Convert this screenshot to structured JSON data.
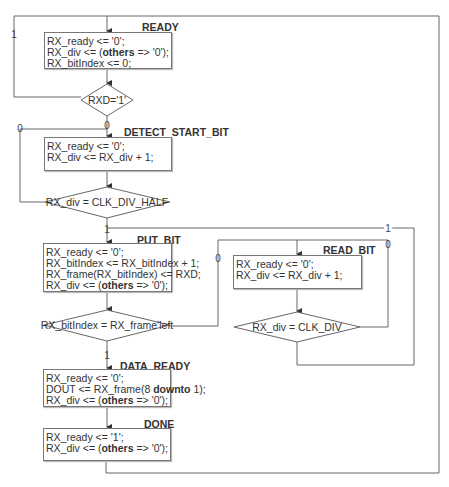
{
  "states": {
    "ready": {
      "name": "READY",
      "lines": [
        "RX_ready <= '0';",
        "RX_div <= (others => '0');",
        "RX_bitIndex <= 0;"
      ]
    },
    "detect_start_bit": {
      "name": "DETECT_START_BIT",
      "lines": [
        "RX_ready <= '0';",
        "RX_div <= RX_div + 1;"
      ]
    },
    "put_bit": {
      "name": "PUT_BIT",
      "lines": [
        "RX_ready <= '0';",
        "RX_bitIndex <= RX_bitIndex + 1;",
        "RX_frame(RX_bitIndex) <= RXD;",
        "RX_div <= (others => '0');"
      ]
    },
    "read_bit": {
      "name": "READ_BIT",
      "lines": [
        "RX_ready <= '0';",
        "RX_div <= RX_div + 1;"
      ]
    },
    "data_ready": {
      "name": "DATA_READY",
      "lines": [
        "RX_ready <= '0';",
        "DOUT <= RX_frame(8 downto 1);",
        "RX_div <= (others => '0');"
      ]
    },
    "done": {
      "name": "DONE",
      "lines": [
        "RX_ready <= '1';",
        "RX_div <= (others => '0');"
      ]
    }
  },
  "decisions": {
    "rxd": {
      "condition": "RXD='1'",
      "true_label": "1",
      "false_label": "0"
    },
    "half": {
      "condition": "RX_div = CLK_DIV_HALF",
      "true_label": "1",
      "false_label": "0"
    },
    "bitindex": {
      "condition": "RX_bitIndex = RX_frame'left",
      "true_label": "1",
      "false_label": "0"
    },
    "clkdiv": {
      "condition": "RX_div = CLK_DIV",
      "true_label": "1",
      "false_label": "0"
    }
  },
  "colors": {
    "line": "#666666",
    "border": "#777777",
    "text": "#333333"
  }
}
